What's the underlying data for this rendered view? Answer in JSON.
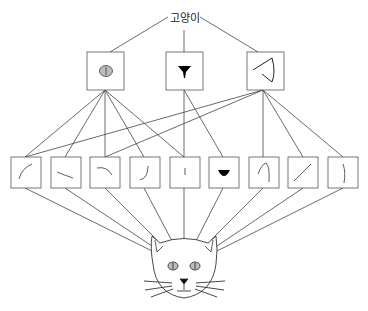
{
  "diagram": {
    "caption_top_cut": "",
    "root_label": "고양이",
    "colors": {
      "stroke": "#444444",
      "eye_fill": "#bbbbbb",
      "nose_fill": "#000000"
    },
    "level2": [
      {
        "name": "eye-feature",
        "icon": "eye-icon"
      },
      {
        "name": "nose-feature",
        "icon": "nose-icon"
      },
      {
        "name": "ear-feature",
        "icon": "ear-icon"
      }
    ],
    "level1": [
      {
        "name": "edge-curve-up",
        "icon": "curve-stroke-icon"
      },
      {
        "name": "edge-slant-down",
        "icon": "slant-stroke-icon"
      },
      {
        "name": "edge-arc",
        "icon": "arc-stroke-icon"
      },
      {
        "name": "edge-hook",
        "icon": "hook-stroke-icon"
      },
      {
        "name": "edge-short-vertical",
        "icon": "short-line-icon"
      },
      {
        "name": "nose-shape",
        "icon": "nose-shape-icon"
      },
      {
        "name": "edge-ear-curve",
        "icon": "ear-curve-icon"
      },
      {
        "name": "edge-diagonal",
        "icon": "diagonal-line-icon"
      },
      {
        "name": "edge-vertical-curve",
        "icon": "vertical-curve-icon"
      }
    ],
    "input": {
      "name": "cat-face-image",
      "icon": "cat-face-icon"
    }
  }
}
